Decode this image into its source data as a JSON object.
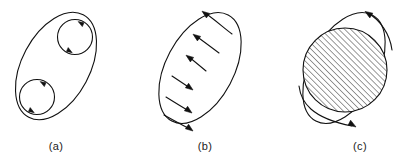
{
  "figure": {
    "background_color": "#ffffff",
    "line_color": "#111111",
    "width": 416,
    "height": 161,
    "panels": [
      {
        "id": "a",
        "label": "(a)",
        "label_x": 56,
        "label_y": 150,
        "description": "tilted ellipse enclosing two small circles with circulation arrows",
        "boundary": {
          "shape": "ellipse",
          "cx": 56,
          "cy": 66,
          "rx": 34,
          "ry": 58,
          "rotation_deg": 28
        },
        "inner_circles": [
          {
            "cx": 75,
            "cy": 37,
            "r": 17.5,
            "circulation": "clockwise"
          },
          {
            "cx": 37,
            "cy": 97,
            "r": 17.5,
            "circulation": "clockwise"
          }
        ]
      },
      {
        "id": "b",
        "label": "(b)",
        "label_x": 205,
        "label_y": 150,
        "description": "tilted ellipse crossed by six curved flow arrows, upper three inward-up-left, lower three outward-down-right",
        "boundary": {
          "shape": "ellipse",
          "cx": 200,
          "cy": 68,
          "rx": 34,
          "ry": 60,
          "rotation_deg": 28
        },
        "arrow_count": 6,
        "arrow_groups": [
          {
            "direction": "up-left",
            "count": 3
          },
          {
            "direction": "down-right",
            "count": 3
          }
        ]
      },
      {
        "id": "c",
        "label": "(c)",
        "label_x": 360,
        "label_y": 150,
        "description": "tilted ellipse overlapped by a large hatched circle, with two curved arrows top-right and bottom-left",
        "boundary": {
          "shape": "ellipse",
          "cx": 344,
          "cy": 68,
          "rx": 34,
          "ry": 60,
          "rotation_deg": 28
        },
        "hatched_circle": {
          "cx": 345,
          "cy": 70,
          "r": 42,
          "hatch_angle_deg": 45,
          "hatch_spacing_px": 3
        },
        "arrow_count": 2,
        "arrow_groups": [
          {
            "direction": "up-left",
            "count": 1
          },
          {
            "direction": "down-right",
            "count": 1
          }
        ]
      }
    ]
  }
}
